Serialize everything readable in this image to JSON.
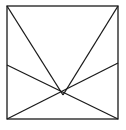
{
  "diagram": {
    "stroke_color": "#1a1a1a",
    "background": "#ffffff",
    "square": {
      "x1": 7,
      "y1": 6,
      "x2": 118,
      "y2": 119
    },
    "center_point": {
      "x": 63,
      "y": 95
    },
    "segments": [
      {
        "name": "top-left-to-center",
        "x1": 7,
        "y1": 6,
        "x2": 63,
        "y2": 95
      },
      {
        "name": "top-right-to-center",
        "x1": 118,
        "y1": 6,
        "x2": 63,
        "y2": 95
      },
      {
        "name": "left-mid-to-bottom-right",
        "x1": 7,
        "y1": 65,
        "x2": 118,
        "y2": 119
      },
      {
        "name": "right-mid-to-bottom-left",
        "x1": 118,
        "y1": 63,
        "x2": 7,
        "y2": 119
      }
    ]
  }
}
